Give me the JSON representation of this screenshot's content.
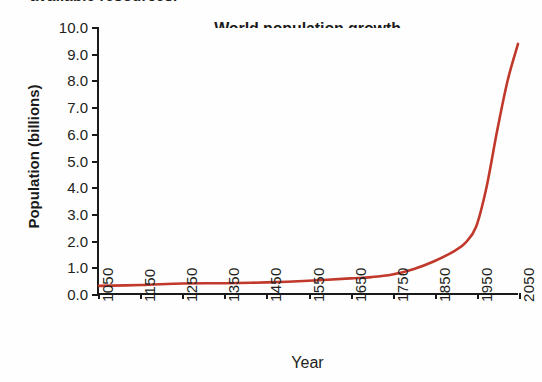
{
  "page": {
    "cutoff_heading": "available resources."
  },
  "chart_data": {
    "type": "line",
    "title": "World population growth",
    "xlabel": "Year",
    "ylabel": "Population (billions)",
    "xlim": [
      1050,
      2050
    ],
    "ylim": [
      0.0,
      10.0
    ],
    "grid": false,
    "legend": "none",
    "line_color": "#C0392B",
    "axis_color": "#1a1a1a",
    "xticks": [
      1050,
      1150,
      1250,
      1350,
      1450,
      1550,
      1650,
      1750,
      1850,
      1950,
      2050
    ],
    "xtick_labels": [
      "1050",
      "1150",
      "1250",
      "1350",
      "1450",
      "1550",
      "1650",
      "1750",
      "1850",
      "1950",
      "2050"
    ],
    "yticks": [
      0.0,
      1.0,
      2.0,
      3.0,
      4.0,
      5.0,
      6.0,
      7.0,
      8.0,
      9.0,
      10.0
    ],
    "ytick_labels": [
      "0.0",
      "1.0",
      "2.0",
      "3.0",
      "4.0",
      "5.0",
      "6.0",
      "7.0",
      "8.0",
      "9.0",
      "10.0"
    ],
    "x": [
      1050,
      1150,
      1250,
      1350,
      1450,
      1550,
      1650,
      1700,
      1750,
      1800,
      1850,
      1900,
      1925,
      1950,
      1975,
      2000,
      2025,
      2050
    ],
    "values": [
      0.27,
      0.3,
      0.36,
      0.37,
      0.4,
      0.46,
      0.55,
      0.6,
      0.7,
      0.9,
      1.2,
      1.6,
      1.9,
      2.5,
      4.0,
      6.1,
      8.0,
      9.4
    ],
    "series": [
      {
        "name": "World population",
        "values": [
          0.27,
          0.3,
          0.36,
          0.37,
          0.4,
          0.46,
          0.55,
          0.6,
          0.7,
          0.9,
          1.2,
          1.6,
          1.9,
          2.5,
          4.0,
          6.1,
          8.0,
          9.4
        ]
      }
    ]
  }
}
